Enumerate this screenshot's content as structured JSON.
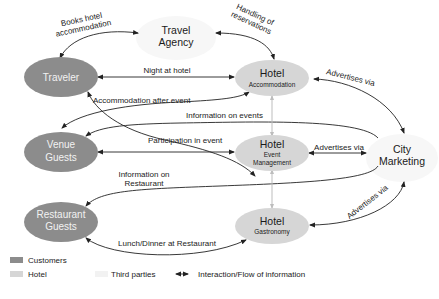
{
  "colors": {
    "customers": "#8c8c8c",
    "hotel": "#d6d6d6",
    "third_parties": "#f7f7f7",
    "edge": "#222222",
    "hotel_link": "#bdbdbd"
  },
  "nodes": {
    "traveler": {
      "label": "Traveler",
      "type": "customers"
    },
    "venue_guests": {
      "line1": "Venue",
      "line2": "Guests",
      "type": "customers"
    },
    "restaurant_guests": {
      "line1": "Restaurant",
      "line2": "Guests",
      "type": "customers"
    },
    "travel_agency": {
      "line1": "Travel",
      "line2": "Agency",
      "type": "third_parties"
    },
    "city_marketing": {
      "line1": "City",
      "line2": "Marketing",
      "type": "third_parties"
    },
    "hotel_accommodation": {
      "title": "Hotel",
      "sub": "Accommodation",
      "type": "hotel"
    },
    "hotel_event_management": {
      "title": "Hotel",
      "sub1": "Event",
      "sub2": "Management",
      "type": "hotel"
    },
    "hotel_gastronomy": {
      "title": "Hotel",
      "sub": "Gastronomy",
      "type": "hotel"
    }
  },
  "edges": {
    "books_hotel": {
      "line1": "Books hotel",
      "line2": "accommodation"
    },
    "handling_reservations": {
      "line1": "Handling of",
      "line2": "reservations"
    },
    "night_at_hotel": {
      "label": "Night at hotel"
    },
    "accommodation_after_event": {
      "label": "Accommodation after event"
    },
    "advertises_accommodation": {
      "label": "Advertises via"
    },
    "information_on_events": {
      "label": "Information on events"
    },
    "participation_in_event": {
      "label": "Participation in event"
    },
    "advertises_event": {
      "label": "Advertises via"
    },
    "information_on_restaurant": {
      "line1": "Information on",
      "line2": "Restaurant"
    },
    "advertises_gastronomy": {
      "label": "Advertises via"
    },
    "lunch_dinner": {
      "label": "Lunch/Dinner at Restaurant"
    }
  },
  "legend": {
    "customers": "Customers",
    "hotel": "Hotel",
    "third_parties": "Third parties",
    "interaction": "Interaction/Flow of information"
  }
}
